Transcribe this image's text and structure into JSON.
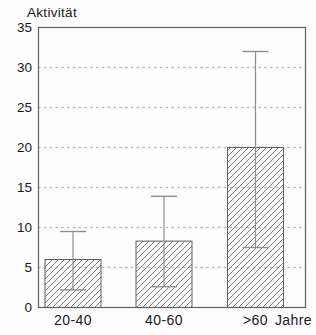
{
  "chart_data": {
    "type": "bar",
    "title": "Aktivität",
    "ylabel": "Aktivität",
    "xlabel": "Jahre",
    "categories": [
      "20-40",
      "40-60",
      ">60"
    ],
    "values": [
      6,
      8.3,
      20
    ],
    "error_low": [
      2.2,
      2.6,
      7.5
    ],
    "error_high": [
      9.5,
      13.9,
      32
    ],
    "ylim": [
      0,
      35
    ],
    "ytick_step": 5,
    "yticks": [
      0,
      5,
      10,
      15,
      20,
      25,
      30,
      35
    ],
    "grid": "horizontal dotted lines at 5,10,15,20,25,30",
    "legend": "none",
    "bar_style": "white fill with forward-diagonal hatching",
    "colors": {
      "background": "#fdfdfd",
      "frame": "#5f5f5f",
      "hatch": "#7d7d7d",
      "bar_border": "#5f5f5f",
      "bar_fill": "#ffffff",
      "error_bar": "#8f8f8f",
      "gridline": "#bdbdbd",
      "text": "#1a1a1a"
    }
  }
}
